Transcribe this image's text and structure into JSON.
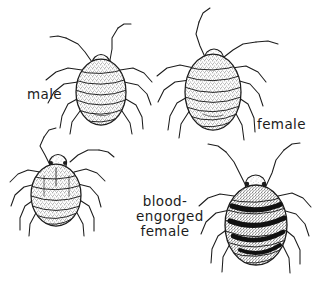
{
  "figure": {
    "background_color": "#ffffff",
    "ink_color": "#1c1c1c",
    "body_fill_color": "#9a9a9a",
    "blood_band_color": "#111111",
    "width": 318,
    "height": 289,
    "style": "pen-and-ink stipple line drawing",
    "specimen_count": 4
  },
  "labels": {
    "male": "male",
    "female": "female",
    "engorged_line1": "blood-",
    "engorged_line2": "engorged",
    "engorged_line3": "female"
  },
  "specimens": [
    {
      "id": "male-bug",
      "label": "male",
      "position": "upper-left",
      "abdomen_segments": 7,
      "engorged": false,
      "blood_bands": 0
    },
    {
      "id": "female-bug",
      "label": "female",
      "position": "upper-right",
      "abdomen_segments": 8,
      "engorged": false,
      "blood_bands": 0
    },
    {
      "id": "unlabeled-bug",
      "label": "",
      "position": "lower-left",
      "abdomen_segments": 7,
      "engorged": false,
      "blood_bands": 0
    },
    {
      "id": "engorged-female-bug",
      "label": "blood-engorged female",
      "position": "lower-right",
      "abdomen_segments": 8,
      "engorged": true,
      "blood_bands": 4
    }
  ]
}
